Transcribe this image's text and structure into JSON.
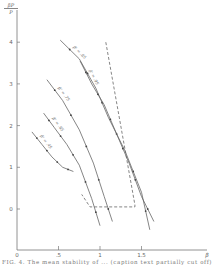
{
  "chart_data": {
    "type": "line",
    "title": "",
    "xlabel": "β",
    "ylabel": "βP/P",
    "ylabel_numerator": "βP",
    "ylabel_denominator": "P",
    "xlim": [
      0,
      2.3
    ],
    "ylim": [
      -1.3,
      4.8
    ],
    "x_ticks": [
      0,
      0.5,
      1,
      1.5
    ],
    "x_tick_labels": [
      "0",
      ".5",
      "1",
      "1.5"
    ],
    "x_end_label": "β",
    "y_ticks": [
      0,
      1,
      2,
      3,
      4
    ],
    "y_tick_labels": [
      "0",
      "1",
      "2",
      "3",
      "4"
    ],
    "grid": false,
    "legend": "inline labels along curves",
    "series": [
      {
        "name": "β' = .45",
        "style": "solid with data points",
        "x": [
          0.18,
          0.3,
          0.42,
          0.55,
          0.68
        ],
        "y": [
          1.85,
          1.55,
          1.25,
          1.0,
          0.9
        ]
      },
      {
        "name": "β' = .65",
        "style": "solid with data points",
        "x": [
          0.32,
          0.45,
          0.6,
          0.75,
          0.9,
          1.0
        ],
        "y": [
          2.3,
          1.95,
          1.55,
          1.05,
          0.25,
          -0.4
        ]
      },
      {
        "name": "β' = .75",
        "style": "solid with data points",
        "x": [
          0.36,
          0.55,
          0.75,
          0.92,
          1.05,
          1.15
        ],
        "y": [
          3.1,
          2.6,
          1.9,
          1.1,
          0.3,
          -0.3
        ]
      },
      {
        "name": "β' = .85",
        "style": "solid with data points",
        "x": [
          0.52,
          0.75,
          0.95,
          1.1,
          1.3,
          1.5,
          1.6
        ],
        "y": [
          4.05,
          3.6,
          2.9,
          2.2,
          1.4,
          0.4,
          -0.5
        ]
      },
      {
        "name": "β' = .95",
        "style": "solid with data points",
        "x": [
          0.76,
          0.9,
          1.05,
          1.2,
          1.35,
          1.5,
          1.65
        ],
        "y": [
          3.55,
          3.0,
          2.5,
          1.8,
          1.1,
          0.3,
          -0.3
        ]
      },
      {
        "name": "boundary",
        "style": "dashed",
        "x": [
          1.07,
          1.42,
          1.42,
          0.88,
          0.78
        ],
        "y": [
          4.0,
          0.1,
          0.05,
          0.05,
          0.35
        ]
      }
    ],
    "annotations": [
      "β' = .45",
      "β' = .65",
      "β' = .75",
      "β' = .85",
      "β' = .95"
    ]
  },
  "caption": "FIG. 4. The mean stability of ... (caption text partially cut off)"
}
